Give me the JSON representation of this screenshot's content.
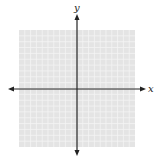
{
  "diagram": {
    "type": "coordinate-plane",
    "grid": {
      "left": 19,
      "top": 30,
      "right": 135,
      "bottom": 147,
      "cells_x": 20,
      "cells_y": 20,
      "background": "#e4e4e4",
      "line_color": "#f4f4f4"
    },
    "axes": {
      "color": "#222222",
      "origin": {
        "x": 77,
        "y": 89
      },
      "x_axis": {
        "from": 8,
        "to": 146,
        "label": "x"
      },
      "y_axis": {
        "from": 14,
        "to": 156,
        "label": "y"
      }
    }
  }
}
